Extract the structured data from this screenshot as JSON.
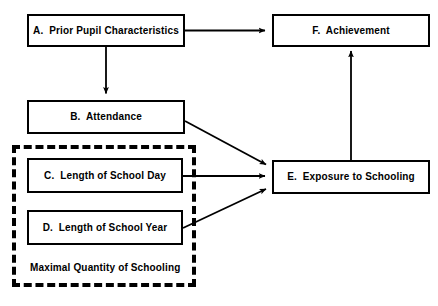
{
  "diagram": {
    "type": "flowchart",
    "title": "",
    "nodes": [
      {
        "id": "A",
        "label": "A.  Prior Pupil Characteristics",
        "x": 27,
        "y": 14,
        "w": 158,
        "h": 33,
        "shape": "rectangle",
        "border": "solid"
      },
      {
        "id": "F",
        "label": "F.  Achievement",
        "x": 272,
        "y": 14,
        "w": 158,
        "h": 33,
        "shape": "rectangle",
        "border": "solid"
      },
      {
        "id": "B",
        "label": "B.  Attendance",
        "x": 27,
        "y": 100,
        "w": 158,
        "h": 34,
        "shape": "rectangle",
        "border": "solid"
      },
      {
        "id": "C",
        "label": "C.  Length of School Day",
        "x": 27,
        "y": 158,
        "w": 156,
        "h": 35,
        "shape": "rectangle",
        "border": "solid"
      },
      {
        "id": "D",
        "label": "D.  Length of School Year",
        "x": 27,
        "y": 210,
        "w": 156,
        "h": 35,
        "shape": "rectangle",
        "border": "solid"
      },
      {
        "id": "E",
        "label": "E.  Exposure to Schooling",
        "x": 272,
        "y": 160,
        "w": 158,
        "h": 34,
        "shape": "rectangle",
        "border": "solid"
      }
    ],
    "group": {
      "id": "maximal-quantity-of-schooling",
      "label": "Maximal Quantity of Schooling",
      "x": 12,
      "y": 145,
      "w": 184,
      "h": 142,
      "border": "dashed",
      "label_x": 30,
      "label_y": 262
    },
    "edges": [
      {
        "from": "A",
        "to": "F",
        "style": "straight-horizontal"
      },
      {
        "from": "A",
        "to": "B",
        "style": "straight-vertical"
      },
      {
        "from": "B",
        "to": "E",
        "style": "diagonal"
      },
      {
        "from": "C",
        "to": "E",
        "style": "straight-horizontal"
      },
      {
        "from": "D",
        "to": "E",
        "style": "diagonal"
      },
      {
        "from": "E",
        "to": "F",
        "style": "straight-vertical"
      }
    ],
    "colors": {
      "stroke": "#000000",
      "fill": "#ffffff",
      "text": "#000000"
    }
  }
}
